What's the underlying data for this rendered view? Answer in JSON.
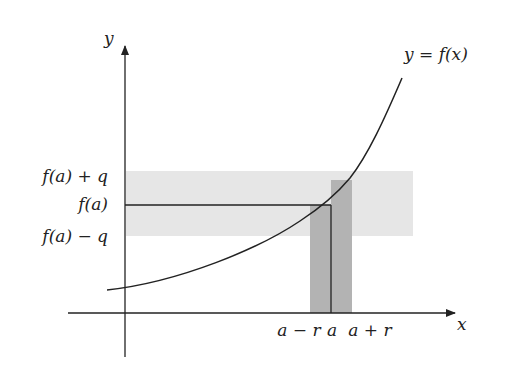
{
  "diagram": {
    "axes": {
      "x_label": "x",
      "y_label": "y"
    },
    "curve_label": "y = f(x)",
    "y_tick_labels": {
      "upper": "f(a) + q",
      "middle": "f(a)",
      "lower": "f(a) − q"
    },
    "x_tick_labels": {
      "left": "a − r",
      "middle": "a",
      "right": "a + r"
    },
    "colors": {
      "axis": "#222222",
      "curve": "#222222",
      "horizontal_band": "#e6e6e6",
      "vertical_band": "#b3b3b3"
    }
  }
}
